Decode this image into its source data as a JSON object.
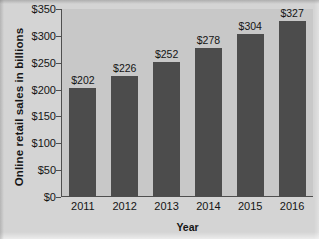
{
  "chart_data": {
    "type": "bar",
    "title": "",
    "xlabel": "Year",
    "ylabel": "Online retail sales in billions",
    "categories": [
      "2011",
      "2012",
      "2013",
      "2014",
      "2015",
      "2016"
    ],
    "values": [
      202,
      226,
      252,
      278,
      304,
      327
    ],
    "value_labels": [
      "$202",
      "$226",
      "$252",
      "$278",
      "$304",
      "$327"
    ],
    "ylim": [
      0,
      350
    ],
    "ytick_values": [
      0,
      50,
      100,
      150,
      200,
      250,
      300,
      350
    ],
    "ytick_labels": [
      "$0",
      "$50",
      "$100",
      "$150",
      "$200",
      "$250",
      "$300",
      "$350"
    ],
    "grid": false,
    "legend": false,
    "legend_position": "none",
    "colors": {
      "bar_fill": "#4c4c4c",
      "plot_background": "#c8c8c8",
      "figure_background": "#d4d4d4",
      "axis": "#4f4f4f",
      "text": "#141414"
    }
  }
}
